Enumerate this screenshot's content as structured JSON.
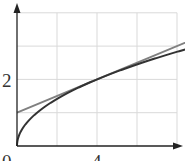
{
  "chart_data": {
    "type": "line",
    "title": "",
    "xlabel": "x",
    "ylabel": "y",
    "xlim": [
      0,
      8.8
    ],
    "ylim": [
      0,
      4
    ],
    "grid": true,
    "x_ticks_labeled": [
      0,
      4
    ],
    "y_ticks_labeled": [
      2
    ],
    "x_grid_values": [
      2,
      4,
      6,
      8
    ],
    "y_grid_values": [
      1,
      2,
      3,
      4
    ],
    "series": [
      {
        "name": "y = sqrt(x)",
        "color": "#333333",
        "x": [
          0,
          0.25,
          0.5,
          1,
          2,
          3,
          4,
          5,
          6,
          7,
          8,
          8.8
        ],
        "values": [
          0,
          0.5,
          0.707,
          1,
          1.414,
          1.732,
          2,
          2.236,
          2.449,
          2.646,
          2.828,
          2.966
        ]
      },
      {
        "name": "tangent at x=4: y = x/4 + 1",
        "color": "#808080",
        "x": [
          0,
          4,
          8.8
        ],
        "values": [
          1,
          2,
          3.2
        ]
      }
    ]
  },
  "labels": {
    "origin": "0",
    "x_tick_4": "4",
    "y_tick_2": "2",
    "y_axis": "y",
    "x_axis": "x"
  },
  "colors": {
    "axis": "#222222",
    "grid": "#d9d9d9",
    "curve": "#333333",
    "tangent": "#808080"
  }
}
